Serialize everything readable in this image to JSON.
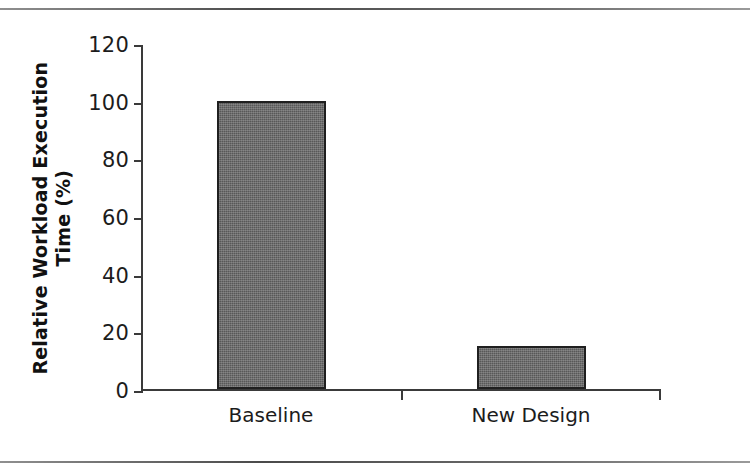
{
  "figure": {
    "separators": [
      "page-rule-top",
      "page-rule-bottom"
    ]
  },
  "chart_data": {
    "type": "bar",
    "title": "",
    "categories": [
      "Baseline",
      "New Design"
    ],
    "values": [
      100,
      15
    ],
    "xlabel": "",
    "ylabel": "Relative Workload Execution Time (%)",
    "ylabel_line1": "Relative Workload Execution",
    "ylabel_line2": "Time (%)",
    "ylim": [
      0,
      120
    ],
    "yticks": [
      0,
      20,
      40,
      60,
      80,
      100,
      120
    ],
    "ytick_labels": [
      "0",
      "20",
      "40",
      "60",
      "80",
      "100",
      "120"
    ],
    "grid": false,
    "legend": null,
    "series": [
      {
        "name": "Relative Workload Execution Time (%)",
        "values": [
          100,
          15
        ],
        "fill_color": "#585858",
        "edge_color": "#1f1f1f"
      }
    ],
    "annotations": []
  },
  "style": {
    "axis_color": "#3a3a3a",
    "text_color": "#1c1c1c",
    "bar_fill": "#585858",
    "bar_edge": "#1f1f1f",
    "background": "#ffffff"
  }
}
